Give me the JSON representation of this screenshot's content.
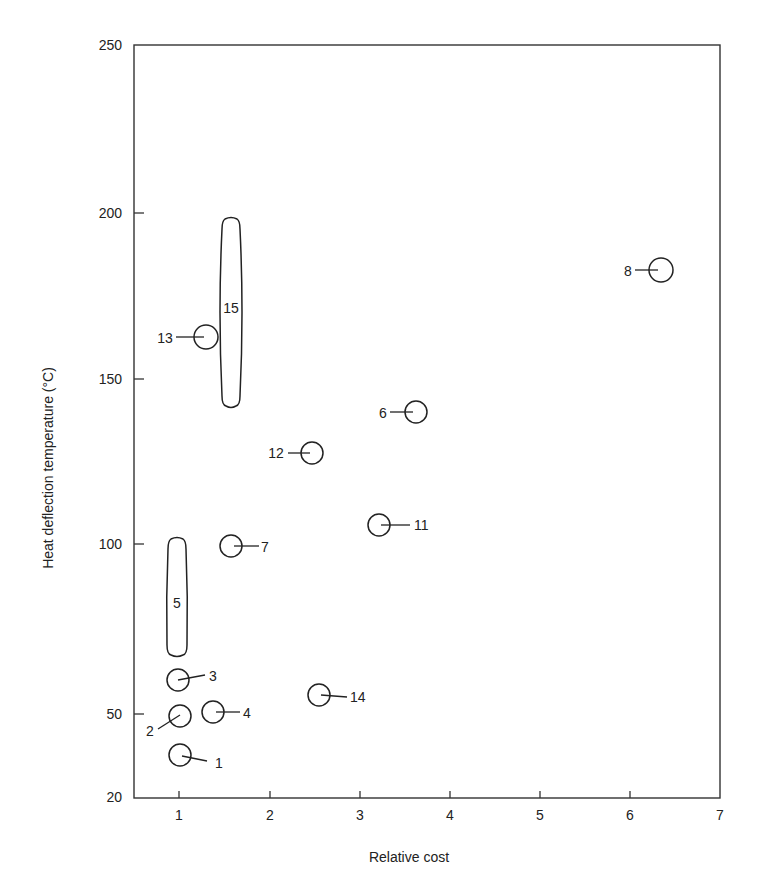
{
  "chart_data": {
    "type": "scatter",
    "title": "",
    "xlabel": "Relative cost",
    "ylabel": "Heat deflection temperature (°C)",
    "xlim": [
      0.5,
      7
    ],
    "ylim": [
      20,
      250
    ],
    "grid": false,
    "legend": "none",
    "x_ticks": [
      {
        "value": 1,
        "label": "1",
        "px": 179
      },
      {
        "value": 2,
        "label": "2",
        "px": 270
      },
      {
        "value": 3,
        "label": "3",
        "px": 360
      },
      {
        "value": 4,
        "label": "4",
        "px": 450
      },
      {
        "value": 5,
        "label": "5",
        "px": 540
      },
      {
        "value": 6,
        "label": "6",
        "px": 630
      },
      {
        "value": 7,
        "label": "7",
        "px": 720
      }
    ],
    "y_ticks": [
      {
        "value": 250,
        "label": "250",
        "py": 45
      },
      {
        "value": 200,
        "label": "200",
        "py": 213
      },
      {
        "value": 150,
        "label": "150",
        "py": 379
      },
      {
        "value": 100,
        "label": "100",
        "py": 544
      },
      {
        "value": 50,
        "label": "50",
        "py": 714
      },
      {
        "value": 20,
        "label": "20",
        "py": 797
      }
    ],
    "points": [
      {
        "id": "1",
        "label": "1",
        "x": 1.0,
        "y": 35,
        "cx": 180,
        "cy": 755,
        "r": 11,
        "lx": 215,
        "ly": 763,
        "leader": [
          182,
          756,
          207,
          761
        ],
        "anchor": "start"
      },
      {
        "id": "2",
        "label": "2",
        "x": 1.0,
        "y": 49,
        "cx": 180,
        "cy": 716,
        "r": 11,
        "lx": 150,
        "ly": 731,
        "leader": [
          158,
          729,
          180,
          715
        ],
        "anchor": "middle"
      },
      {
        "id": "3",
        "label": "3",
        "x": 1.0,
        "y": 60,
        "cx": 178,
        "cy": 680,
        "r": 11,
        "lx": 209,
        "ly": 676,
        "leader": [
          178,
          680,
          205,
          675
        ],
        "anchor": "start"
      },
      {
        "id": "4",
        "label": "4",
        "x": 1.4,
        "y": 51,
        "cx": 213,
        "cy": 712,
        "r": 11,
        "lx": 243,
        "ly": 713,
        "leader": [
          216,
          712,
          240,
          712
        ],
        "anchor": "start"
      },
      {
        "id": "6",
        "label": "6",
        "x": 3.6,
        "y": 140,
        "cx": 416,
        "cy": 412,
        "r": 11,
        "lx": 383,
        "ly": 413,
        "leader": [
          390,
          412,
          413,
          412
        ],
        "anchor": "middle"
      },
      {
        "id": "7",
        "label": "7",
        "x": 1.6,
        "y": 99,
        "cx": 231,
        "cy": 546,
        "r": 11,
        "lx": 265,
        "ly": 547,
        "leader": [
          234,
          546,
          259,
          546
        ],
        "anchor": "middle"
      },
      {
        "id": "8",
        "label": "8",
        "x": 6.35,
        "y": 183,
        "cx": 661,
        "cy": 270,
        "r": 12,
        "lx": 628,
        "ly": 271,
        "leader": [
          635,
          270,
          658,
          270
        ],
        "anchor": "middle"
      },
      {
        "id": "11",
        "label": "11",
        "x": 3.2,
        "y": 106,
        "cx": 379,
        "cy": 525,
        "r": 11,
        "lx": 414,
        "ly": 525,
        "leader": [
          381,
          525,
          410,
          525
        ],
        "anchor": "start"
      },
      {
        "id": "12",
        "label": "12",
        "x": 2.45,
        "y": 128,
        "cx": 312,
        "cy": 453,
        "r": 11,
        "lx": 276,
        "ly": 453,
        "leader": [
          288,
          453,
          310,
          453
        ],
        "anchor": "middle"
      },
      {
        "id": "13",
        "label": "13",
        "x": 1.3,
        "y": 163,
        "cx": 206,
        "cy": 337,
        "r": 12,
        "lx": 165,
        "ly": 338,
        "leader": [
          176,
          337,
          204,
          337
        ],
        "anchor": "middle"
      },
      {
        "id": "14",
        "label": "14",
        "x": 2.55,
        "y": 56,
        "cx": 319,
        "cy": 695,
        "r": 11,
        "lx": 350,
        "ly": 697,
        "leader": [
          321,
          695,
          347,
          697
        ],
        "anchor": "start"
      }
    ],
    "ranges": [
      {
        "id": "5",
        "label": "5",
        "x": 1.0,
        "y_min": 67,
        "y_max": 101,
        "cx": 177,
        "y_top": 539,
        "y_bottom": 655,
        "w_top": 18,
        "w_mid": 20,
        "w_bottom": 20,
        "lx": 177,
        "ly": 608
      },
      {
        "id": "15",
        "label": "15",
        "x": 1.55,
        "y_min": 142,
        "y_max": 198,
        "cx": 231,
        "y_top": 219,
        "y_bottom": 406,
        "w_top": 18,
        "w_mid": 24,
        "w_bottom": 18,
        "lx": 231,
        "ly": 313
      }
    ]
  }
}
